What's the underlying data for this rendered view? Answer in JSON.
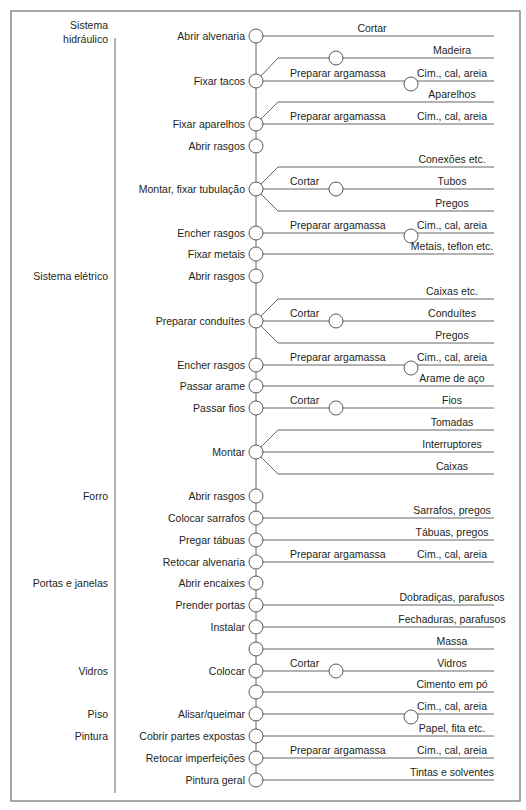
{
  "layout": {
    "frame": {
      "x": 11,
      "y": 11,
      "w": 509,
      "h": 790
    },
    "section_line": {
      "x": 115,
      "y1": 38,
      "y2": 793
    },
    "spine_x": 256,
    "node_r": 7,
    "right_x": 494,
    "mid_node_x": 336,
    "end_node_x": 411,
    "branch_x": 278,
    "text_color": "#231f20",
    "line_color": "#555555"
  },
  "sections": [
    {
      "label_lines": [
        "Sistema",
        "hidráulico"
      ],
      "y": 36
    },
    {
      "label_lines": [
        "Sistema elétrico"
      ],
      "y": 276
    },
    {
      "label_lines": [
        "Forro"
      ],
      "y": 496
    },
    {
      "label_lines": [
        "Portas e janelas"
      ],
      "y": 583
    },
    {
      "label_lines": [
        "Vidros"
      ],
      "y": 671
    },
    {
      "label_lines": [
        "Piso"
      ],
      "y": 714
    },
    {
      "label_lines": [
        "Pintura"
      ],
      "y": 736
    }
  ],
  "steps": [
    {
      "label": "Abrir alvenaria",
      "y": 36,
      "branches": [
        {
          "dy": 0,
          "mid_label": "Cortar",
          "mid_node": false,
          "end_label": "",
          "end_node": false,
          "top_label": "Cortar"
        }
      ]
    },
    {
      "label": "Fixar tacos",
      "y": 81,
      "branches": [
        {
          "dy": -23,
          "mid_label": "",
          "mid_node": true,
          "end_label": "Madeira",
          "end_node": false
        },
        {
          "dy": 0,
          "mid_label": "Preparar argamassa",
          "mid_node": false,
          "end_label": "Cim., cal, areia",
          "end_node": true
        }
      ]
    },
    {
      "label": "Fixar aparelhos",
      "y": 124,
      "branches": [
        {
          "dy": -22,
          "mid_label": "",
          "mid_node": false,
          "end_label": "Aparelhos",
          "end_node": false
        },
        {
          "dy": 0,
          "mid_label": "Preparar argamassa",
          "mid_node": false,
          "end_label": "Cim., cal, areia",
          "end_node": false
        }
      ]
    },
    {
      "label": "Abrir rasgos",
      "y": 146,
      "branches": []
    },
    {
      "label": "Montar, fixar tubulação",
      "y": 189,
      "branches": [
        {
          "dy": -22,
          "mid_label": "",
          "mid_node": false,
          "end_label": "Conexões etc.",
          "end_node": false
        },
        {
          "dy": 0,
          "mid_label": "Cortar",
          "mid_node": true,
          "end_label": "Tubos",
          "end_node": false
        },
        {
          "dy": 22,
          "mid_label": "",
          "mid_node": false,
          "end_label": "Pregos",
          "end_node": false
        }
      ]
    },
    {
      "label": "Encher rasgos",
      "y": 233,
      "branches": [
        {
          "dy": 0,
          "mid_label": "Preparar argamassa",
          "mid_node": false,
          "end_label": "Cim., cal, areia",
          "end_node": true
        }
      ]
    },
    {
      "label": "Fixar metais",
      "y": 254,
      "branches": [
        {
          "dy": 0,
          "mid_label": "",
          "mid_node": false,
          "end_label": "Metais, teflon etc.",
          "end_node": false
        }
      ]
    },
    {
      "label": "Abrir rasgos",
      "y": 276,
      "branches": []
    },
    {
      "label": "Preparar conduítes",
      "y": 321,
      "branches": [
        {
          "dy": -22,
          "mid_label": "",
          "mid_node": false,
          "end_label": "Caixas etc.",
          "end_node": false
        },
        {
          "dy": 0,
          "mid_label": "Cortar",
          "mid_node": true,
          "end_label": "Conduítes",
          "end_node": false
        },
        {
          "dy": 22,
          "mid_label": "",
          "mid_node": false,
          "end_label": "Pregos",
          "end_node": false
        }
      ]
    },
    {
      "label": "Encher rasgos",
      "y": 365,
      "branches": [
        {
          "dy": 0,
          "mid_label": "Preparar argamassa",
          "mid_node": false,
          "end_label": "Cim., cal, areia",
          "end_node": true
        }
      ]
    },
    {
      "label": "Passar arame",
      "y": 386,
      "branches": [
        {
          "dy": 0,
          "mid_label": "",
          "mid_node": false,
          "end_label": "Arame de aço",
          "end_node": false
        }
      ]
    },
    {
      "label": "Passar fios",
      "y": 408,
      "branches": [
        {
          "dy": 0,
          "mid_label": "Cortar",
          "mid_node": true,
          "end_label": "Fios",
          "end_node": false
        }
      ]
    },
    {
      "label": "Montar",
      "y": 452,
      "branches": [
        {
          "dy": -22,
          "mid_label": "",
          "mid_node": false,
          "end_label": "Tomadas",
          "end_node": false
        },
        {
          "dy": 0,
          "mid_label": "",
          "mid_node": false,
          "end_label": "Interruptores",
          "end_node": false
        },
        {
          "dy": 22,
          "mid_label": "",
          "mid_node": false,
          "end_label": "Caixas",
          "end_node": false
        }
      ]
    },
    {
      "label": "Abrir rasgos",
      "y": 496,
      "branches": []
    },
    {
      "label": "Colocar sarrafos",
      "y": 518,
      "branches": [
        {
          "dy": 0,
          "mid_label": "",
          "mid_node": false,
          "end_label": "Sarrafos, pregos",
          "end_node": false
        }
      ]
    },
    {
      "label": "Pregar tábuas",
      "y": 540,
      "branches": [
        {
          "dy": 0,
          "mid_label": "",
          "mid_node": false,
          "end_label": "Tábuas, pregos",
          "end_node": false
        }
      ]
    },
    {
      "label": "Retocar alvenaria",
      "y": 562,
      "branches": [
        {
          "dy": 0,
          "mid_label": "Preparar argamassa",
          "mid_node": false,
          "end_label": "Cim., cal, areia",
          "end_node": false
        }
      ]
    },
    {
      "label": "Abrir encaixes",
      "y": 583,
      "branches": []
    },
    {
      "label": "Prender portas",
      "y": 605,
      "branches": [
        {
          "dy": 0,
          "mid_label": "",
          "mid_node": false,
          "end_label": "Dobradiças, parafusos",
          "end_node": false
        }
      ]
    },
    {
      "label": "Instalar",
      "y": 627,
      "branches": [
        {
          "dy": 0,
          "mid_label": "",
          "mid_node": false,
          "end_label": "Fechaduras, parafusos",
          "end_node": false
        }
      ]
    },
    {
      "label": "",
      "y": 649,
      "branches": [
        {
          "dy": 0,
          "mid_label": "",
          "mid_node": false,
          "end_label": "Massa",
          "end_node": false
        }
      ]
    },
    {
      "label": "Colocar",
      "y": 671,
      "branches": [
        {
          "dy": 0,
          "mid_label": "Cortar",
          "mid_node": true,
          "end_label": "Vidros",
          "end_node": false
        }
      ]
    },
    {
      "label": "",
      "y": 692,
      "branches": [
        {
          "dy": 0,
          "mid_label": "",
          "mid_node": false,
          "end_label": "Cimento em pó",
          "end_node": false
        }
      ]
    },
    {
      "label": "Alisar/queimar",
      "y": 714,
      "branches": [
        {
          "dy": 0,
          "mid_label": "",
          "mid_node": false,
          "end_label": "Cim., cal, areia",
          "end_node": true
        }
      ]
    },
    {
      "label": "Cobrir partes expostas",
      "y": 736,
      "branches": [
        {
          "dy": 0,
          "mid_label": "",
          "mid_node": false,
          "end_label": "Papel, fita etc.",
          "end_node": false
        }
      ]
    },
    {
      "label": "Retocar imperfeições",
      "y": 758,
      "branches": [
        {
          "dy": 0,
          "mid_label": "Preparar argamassa",
          "mid_node": false,
          "end_label": "Cim., cal, areia",
          "end_node": false
        }
      ]
    },
    {
      "label": "Pintura geral",
      "y": 780,
      "branches": [
        {
          "dy": 0,
          "mid_label": "",
          "mid_node": false,
          "end_label": "Tintas e solventes",
          "end_node": false
        }
      ]
    }
  ]
}
